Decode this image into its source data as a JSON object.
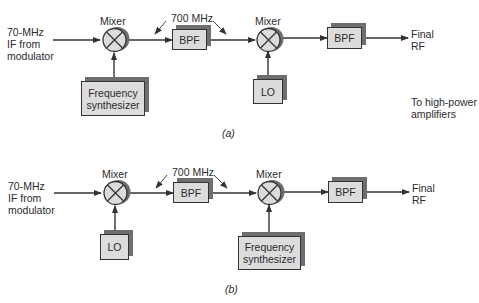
{
  "diagrams": {
    "a": {
      "caption": "(a)",
      "input_label": "70-MHz\nIF from\nmodulator",
      "mixer1_label": "Mixer",
      "mixer2_label": "Mixer",
      "freq_label": "700 MHz",
      "bpf1_label": "BPF",
      "bpf2_label": "BPF",
      "mixer1_source": "Frequency\nsynthesizer",
      "mixer2_source": "LO",
      "output_label": "Final\nRF",
      "destination_note": "To high-power\namplifiers"
    },
    "b": {
      "caption": "(b)",
      "input_label": "70-MHz\nIF from\nmodulator",
      "mixer1_label": "Mixer",
      "mixer2_label": "Mixer",
      "freq_label": "700 MHz",
      "bpf1_label": "BPF",
      "bpf2_label": "BPF",
      "mixer1_source": "LO",
      "mixer2_source": "Frequency\nsynthesizer",
      "output_label": "Final\nRF"
    }
  },
  "colors": {
    "box_fill": "#dcdcdc",
    "box_shadow": "#6e6e6e",
    "line": "#333333",
    "text": "#2b2b2b"
  }
}
